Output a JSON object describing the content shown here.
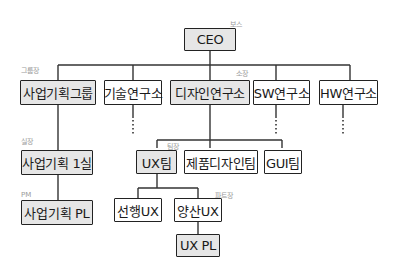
{
  "diagram": {
    "type": "org-chart",
    "nodes": {
      "ceo": {
        "label": "CEO",
        "role": "보스",
        "fill": "gray"
      },
      "biz_group": {
        "label": "사업기획그룹",
        "role": "그룹장",
        "fill": "gray"
      },
      "tech_lab": {
        "label": "기술연구소",
        "fill": "white"
      },
      "design_lab": {
        "label": "디자인연구소",
        "role": "소장",
        "fill": "gray"
      },
      "sw_lab": {
        "label": "SW연구소",
        "fill": "white"
      },
      "hw_lab": {
        "label": "HW연구소",
        "fill": "white"
      },
      "biz_office1": {
        "label": "사업기획 1실",
        "role": "실장",
        "fill": "gray"
      },
      "biz_pl": {
        "label": "사업기획 PL",
        "role": "PM",
        "fill": "gray"
      },
      "ux_team": {
        "label": "UX팀",
        "role": "팀장",
        "fill": "gray"
      },
      "product_design_team": {
        "label": "제품디자인팀",
        "fill": "white"
      },
      "gui_team": {
        "label": "GUI팀",
        "fill": "white"
      },
      "advanced_ux": {
        "label": "선행UX",
        "fill": "white"
      },
      "mass_ux": {
        "label": "양산UX",
        "role": "파트장",
        "fill": "white"
      },
      "ux_pl": {
        "label": "UX PL",
        "fill": "gray"
      }
    },
    "edges": [
      [
        "ceo",
        "biz_group"
      ],
      [
        "ceo",
        "tech_lab"
      ],
      [
        "ceo",
        "design_lab"
      ],
      [
        "ceo",
        "sw_lab"
      ],
      [
        "ceo",
        "hw_lab"
      ],
      [
        "biz_group",
        "biz_office1"
      ],
      [
        "biz_office1",
        "biz_pl"
      ],
      [
        "design_lab",
        "ux_team"
      ],
      [
        "design_lab",
        "product_design_team"
      ],
      [
        "design_lab",
        "gui_team"
      ],
      [
        "ux_team",
        "advanced_ux"
      ],
      [
        "ux_team",
        "mass_ux"
      ],
      [
        "mass_ux",
        "ux_pl"
      ]
    ],
    "continuation_markers": [
      "tech_lab",
      "sw_lab",
      "hw_lab",
      "product_design_team",
      "gui_team"
    ],
    "colors": {
      "gray_fill": "#e6e6e6",
      "line": "#222222",
      "role_text": "#9a9a9a"
    }
  }
}
